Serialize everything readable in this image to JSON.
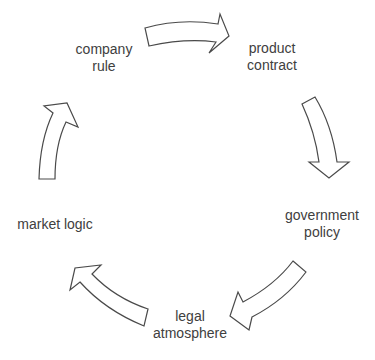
{
  "diagram": {
    "type": "cycle",
    "direction": "clockwise",
    "text_color": "#404040",
    "arrow_stroke": "#4a4a4a",
    "arrow_fill": "#ffffff",
    "nodes": [
      {
        "id": "company",
        "lines": [
          "company",
          "rule"
        ]
      },
      {
        "id": "product",
        "lines": [
          "product",
          "contract"
        ]
      },
      {
        "id": "government",
        "lines": [
          "government",
          "policy"
        ]
      },
      {
        "id": "legal",
        "lines": [
          "legal",
          "atmosphere"
        ]
      },
      {
        "id": "market",
        "lines": [
          "market logic"
        ]
      }
    ],
    "edges": [
      {
        "from": "company",
        "to": "product",
        "icon": "curved-arrow-right-icon"
      },
      {
        "from": "product",
        "to": "government",
        "icon": "curved-arrow-down-icon"
      },
      {
        "from": "government",
        "to": "legal",
        "icon": "curved-arrow-down-left-icon"
      },
      {
        "from": "legal",
        "to": "market",
        "icon": "curved-arrow-up-left-icon"
      },
      {
        "from": "market",
        "to": "company",
        "icon": "curved-arrow-up-icon"
      }
    ]
  }
}
